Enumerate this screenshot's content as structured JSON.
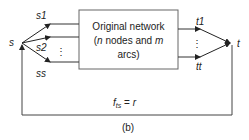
{
  "diagram": {
    "source_node": {
      "label": "s"
    },
    "sink_node": {
      "label": "t"
    },
    "sources": [
      {
        "label": "s1"
      },
      {
        "label": "s2"
      },
      {
        "label": "ss"
      }
    ],
    "sinks": [
      {
        "label": "t1"
      },
      {
        "label": "tt"
      }
    ],
    "ellipsis": "⋮",
    "box": {
      "line1": "Original network",
      "line2_pre": "(",
      "line2_n": "n",
      "line2_mid": " nodes and ",
      "line2_m": "m",
      "line3": "arcs)"
    },
    "return_arc": {
      "f": "f",
      "sub": "ts",
      "eq": " = ",
      "r": "r"
    },
    "caption": "(b)",
    "colors": {
      "line": "#333333",
      "box_border": "#555555",
      "text": "#222222"
    }
  }
}
